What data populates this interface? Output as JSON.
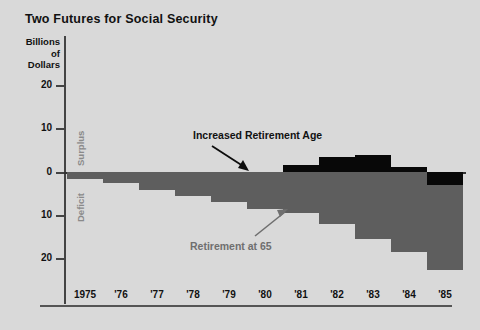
{
  "chart": {
    "title": "Two Futures for Social Security",
    "y_axis_header_lines": [
      "Billions",
      "of",
      "Dollars"
    ],
    "surplus_label": "Surplus",
    "deficit_label": "Deficit",
    "annotation_black": "Increased Retirement Age",
    "annotation_gray": "Retirement at 65",
    "colors": {
      "background": "#d9d9d9",
      "black_series": "#080808",
      "gray_series": "#5e5e5e",
      "axis": "#444444",
      "gray_text": "#6f6f6f"
    }
  },
  "chart_data": {
    "type": "bar",
    "title": "Two Futures for Social Security",
    "xlabel": "",
    "ylabel": "Billions of Dollars",
    "ylim": [
      -24,
      22
    ],
    "grid": false,
    "legend": "annotations",
    "axis_ticks_y": [
      "20",
      "10",
      "0",
      "10",
      "20"
    ],
    "axis_tick_values_y": [
      20,
      10,
      0,
      -10,
      -20
    ],
    "categories": [
      "1975",
      "'76",
      "'77",
      "'78",
      "'79",
      "'80",
      "'81",
      "'82",
      "'83",
      "'84",
      "'85"
    ],
    "series": [
      {
        "name": "Increased Retirement Age",
        "color": "#080808",
        "values": [
          -1.5,
          -2.5,
          -4.0,
          -5.5,
          -1.0,
          -1.5,
          1.5,
          3.5,
          4.0,
          -0.5,
          -3.0
        ]
      },
      {
        "name": "Retirement at 65",
        "color": "#5e5e5e",
        "values": [
          -1.5,
          -2.5,
          -4.0,
          -5.5,
          -7.0,
          -8.5,
          -9.5,
          -12.0,
          -15.5,
          -18.5,
          -22.5
        ]
      }
    ],
    "annotations": [
      {
        "text": "Increased Retirement Age",
        "points_to": "'81"
      },
      {
        "text": "Retirement at 65",
        "points_to": "'81"
      }
    ]
  },
  "y_ticks": [
    {
      "label": "20",
      "y": 85
    },
    {
      "label": "10",
      "y": 128
    },
    {
      "label": "0",
      "y": 172
    },
    {
      "label": "10",
      "y": 215
    },
    {
      "label": "20",
      "y": 258
    }
  ],
  "x_ticks": [
    {
      "label": "1975",
      "x": 67
    },
    {
      "label": "'76",
      "x": 103
    },
    {
      "label": "'77",
      "x": 139
    },
    {
      "label": "'78",
      "x": 175
    },
    {
      "label": "'79",
      "x": 211
    },
    {
      "label": "'80",
      "x": 247
    },
    {
      "label": "'81",
      "x": 283
    },
    {
      "label": "'82",
      "x": 319
    },
    {
      "label": "'83",
      "x": 355
    },
    {
      "label": "'84",
      "x": 391
    },
    {
      "label": "'85",
      "x": 427
    }
  ],
  "bars": [
    {
      "year": "1975",
      "x": 67,
      "w": 36,
      "black_top": 172,
      "black_h": 7,
      "gray_top": 172,
      "gray_h": 7
    },
    {
      "year": "'76",
      "x": 103,
      "w": 36,
      "black_top": 172,
      "black_h": 11,
      "gray_top": 172,
      "gray_h": 11
    },
    {
      "year": "'77",
      "x": 139,
      "w": 36,
      "black_top": 172,
      "black_h": 18,
      "gray_top": 172,
      "gray_h": 18
    },
    {
      "year": "'78",
      "x": 175,
      "w": 36,
      "black_top": 172,
      "black_h": 24,
      "gray_top": 172,
      "gray_h": 24
    },
    {
      "year": "'79",
      "x": 211,
      "w": 36,
      "black_top": 172,
      "black_h": 5,
      "gray_top": 172,
      "gray_h": 30
    },
    {
      "year": "'80",
      "x": 247,
      "w": 36,
      "black_top": 172,
      "black_h": 7,
      "gray_top": 172,
      "gray_h": 37
    },
    {
      "year": "'81",
      "x": 283,
      "w": 36,
      "black_top": 165,
      "black_h": 7,
      "gray_top": 172,
      "gray_h": 41
    },
    {
      "year": "'82",
      "x": 319,
      "w": 36,
      "black_top": 157,
      "black_h": 15,
      "gray_top": 172,
      "gray_h": 52
    },
    {
      "year": "'83",
      "x": 355,
      "w": 36,
      "black_top": 155,
      "black_h": 17,
      "gray_top": 172,
      "gray_h": 67
    },
    {
      "year": "'84",
      "x": 391,
      "w": 36,
      "black_top": 167,
      "black_h": 5,
      "gray_top": 172,
      "gray_h": 80
    },
    {
      "year": "'85",
      "x": 427,
      "w": 36,
      "black_top": 172,
      "black_h": 13,
      "gray_top": 185,
      "gray_h": 85
    }
  ]
}
